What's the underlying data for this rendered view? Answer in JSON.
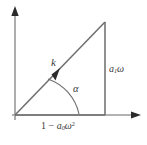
{
  "figure": {
    "kind": "phasor-right-triangle-diagram",
    "background_color": "#ffffff",
    "line_color": "#6d6d6d",
    "axis_color": "#9a9a9a",
    "text_color": "#3a3a3a",
    "labels": {
      "hypotenuse": "k",
      "angle": "α",
      "vertical_side_base": "a",
      "vertical_side_sub": "1",
      "vertical_side_tail": "ω",
      "horizontal_prefix": "1 − ",
      "horizontal_base": "a",
      "horizontal_sub": "0",
      "horizontal_tail": "ω",
      "horizontal_sup": "2"
    },
    "geometry": {
      "origin_x": 15,
      "origin_y": 115,
      "apex_x": 105,
      "apex_y": 22,
      "foot_x": 105,
      "foot_y": 115,
      "y_axis_top": 10,
      "x_axis_right": 141,
      "arc_radius": 48,
      "vector_arrow_x": 62,
      "vector_arrow_y": 70
    }
  }
}
